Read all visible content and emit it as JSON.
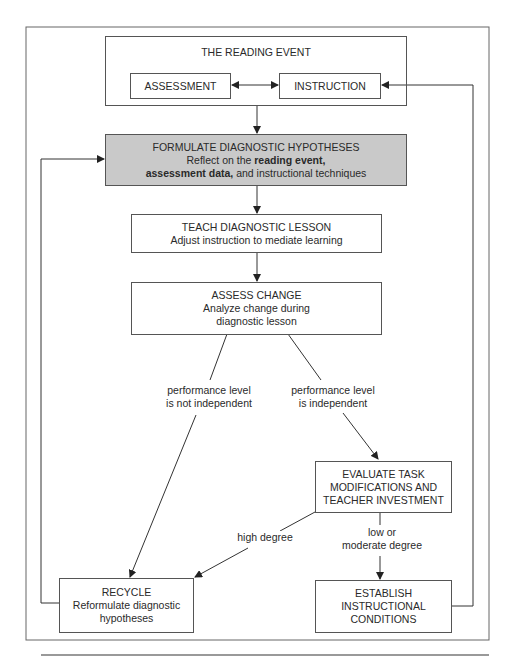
{
  "diagram": {
    "reading_event": {
      "title": "THE READING EVENT",
      "assessment": "ASSESSMENT",
      "instruction": "INSTRUCTION"
    },
    "formulate": {
      "title": "FORMULATE DIAGNOSTIC HYPOTHESES",
      "line1_prefix": "Reflect on the ",
      "line1_bold": "reading event,",
      "line2_bold": "assessment data,",
      "line2_suffix": " and instructional techniques",
      "fill_color": "#c9c9c9"
    },
    "teach": {
      "title": "TEACH DIAGNOSTIC LESSON",
      "subtitle": "Adjust instruction to mediate learning"
    },
    "assess_change": {
      "title": "ASSESS CHANGE",
      "subtitle_line1": "Analyze change during",
      "subtitle_line2": "diagnostic lesson"
    },
    "branch_labels": {
      "not_independent_line1": "performance level",
      "not_independent_line2": "is not independent",
      "independent_line1": "performance level",
      "independent_line2": "is independent",
      "high_degree": "high degree",
      "low_moderate_line1": "low or",
      "low_moderate_line2": "moderate degree"
    },
    "evaluate": {
      "line1": "EVALUATE TASK",
      "line2": "MODIFICATIONS AND",
      "line3": "TEACHER INVESTMENT"
    },
    "recycle": {
      "title": "RECYCLE",
      "line1": "Reformulate diagnostic",
      "line2": "hypotheses"
    },
    "establish": {
      "line1": "ESTABLISH",
      "line2": "INSTRUCTIONAL",
      "line3": "CONDITIONS"
    }
  }
}
